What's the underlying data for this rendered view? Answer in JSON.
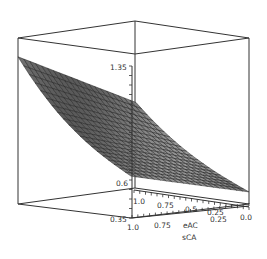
{
  "chart_data": {
    "type": "surface3d",
    "title": "",
    "axes": {
      "z": {
        "label": "",
        "ticks": [
          "1.35",
          "0.6",
          "0.35"
        ],
        "range": [
          0.35,
          1.5
        ]
      },
      "x": {
        "label": "sCA",
        "ticks": [
          "1.0",
          "0.75",
          "0.5",
          "0.25",
          "0.0"
        ],
        "range": [
          0,
          1
        ]
      },
      "y": {
        "label": "eAC",
        "ticks": [
          "1.0",
          "0.75",
          "0.5",
          "0.25",
          "0.0"
        ],
        "range": [
          0,
          1
        ]
      }
    },
    "surface": {
      "description": "Saddle-like surface: high (~1.45) at sCA=1, eAC=1 corner, falling toward ~0.4 at sCA=0 corner",
      "grid": 20,
      "fill_color": "#8a8a8a",
      "mesh_color": "#222222"
    },
    "box": true
  },
  "labels": {
    "z_top": "1.35",
    "z_bottom": "0.6",
    "z_min": "0.35",
    "y_axis_title": "eAC",
    "x_axis_title": "sCA",
    "y_ticks": [
      "1.0",
      "0.75",
      "0.5",
      "0.25",
      "0.0"
    ],
    "x_ticks": [
      "1.0",
      "0.75",
      "0.5",
      "0.25"
    ]
  }
}
